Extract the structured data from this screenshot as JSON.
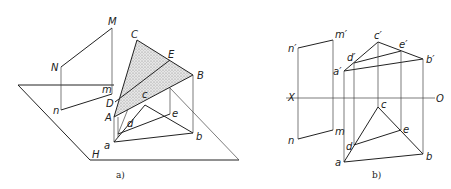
{
  "figure_a": {
    "caption": "a)",
    "labels": {
      "M": "M",
      "N": "N",
      "m": "m",
      "n": "n",
      "C": "C",
      "E": "E",
      "B": "B",
      "D": "D",
      "A": "A",
      "c": "c",
      "d": "d",
      "e": "e",
      "a": "a",
      "b": "b",
      "H": "H"
    }
  },
  "figure_b": {
    "caption": "b)",
    "labels": {
      "X": "X",
      "O": "O",
      "n_prime": "n′",
      "m_prime": "m′",
      "n": "n",
      "m": "m",
      "c_prime": "c′",
      "d_prime": "d′",
      "e_prime": "e′",
      "b_prime": "b′",
      "a_prime": "a′",
      "c": "c",
      "d": "d",
      "e": "e",
      "b": "b",
      "a": "a"
    }
  },
  "colors": {
    "line": "#222222",
    "shade": "#bdbdbd",
    "background": "#ffffff"
  }
}
